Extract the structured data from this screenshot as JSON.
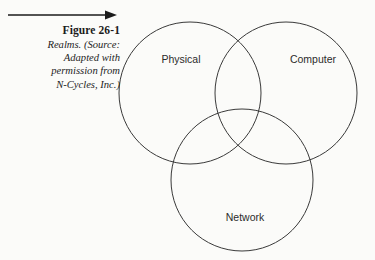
{
  "figure": {
    "title": "Figure 26-1",
    "description_lines": [
      "Realms. (Source:",
      "Adapted with",
      "permission from",
      "N-Cycles, Inc.)"
    ],
    "pointer_icon": "right-arrow-icon"
  },
  "diagram": {
    "type": "venn",
    "background_color": "#fbfbf9",
    "stroke_color": "#3a3a3a",
    "sets": [
      {
        "label": "Physical",
        "cx": 80,
        "cy": 93,
        "r": 71
      },
      {
        "label": "Computer",
        "cx": 176,
        "cy": 93,
        "r": 71
      },
      {
        "label": "Network",
        "cx": 132,
        "cy": 180,
        "r": 71
      }
    ],
    "labels": [
      {
        "text": "Physical",
        "x": 71,
        "y": 63,
        "anchor": "middle"
      },
      {
        "text": "Computer",
        "x": 203,
        "y": 63,
        "anchor": "middle"
      },
      {
        "text": "Network",
        "x": 135,
        "y": 221,
        "anchor": "middle"
      }
    ]
  }
}
